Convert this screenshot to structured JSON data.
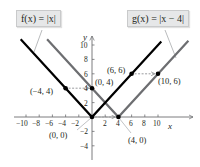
{
  "chart_data": {
    "type": "line",
    "title": "",
    "xlabel": "x",
    "ylabel": "y",
    "xlim": [
      -11,
      14.5
    ],
    "ylim": [
      -5,
      11
    ],
    "grid": false,
    "x_ticks": [
      -10,
      -8,
      -6,
      -4,
      -2,
      2,
      4,
      6,
      8,
      10
    ],
    "y_ticks": [
      -4,
      -2,
      2,
      4,
      6,
      8,
      10
    ],
    "x_tick_labels": [
      "−10",
      "−8",
      "−6",
      "−4",
      "−2",
      "2",
      "4",
      "6",
      "8",
      "10"
    ],
    "y_tick_labels": [
      "−4",
      "−2",
      "2",
      "4",
      "6",
      "8",
      "10"
    ],
    "series": [
      {
        "name": "f(x) = |x|",
        "color": "#000000",
        "x": [
          -10.8,
          0,
          10.5
        ],
        "y": [
          10.8,
          0,
          10.5
        ]
      },
      {
        "name": "g(x) = |x − 4|",
        "color": "#6d6e71",
        "x": [
          -6.8,
          4,
          14.6
        ],
        "y": [
          10.8,
          0,
          10.6
        ]
      }
    ],
    "points": [
      {
        "label": "(−4, 4)",
        "x": -4,
        "y": 4,
        "series": "f"
      },
      {
        "label": "(0, 4)",
        "x": 0,
        "y": 4,
        "series": "g"
      },
      {
        "label": "(6, 6)",
        "x": 6,
        "y": 6,
        "series": "f"
      },
      {
        "label": "(10, 6)",
        "x": 10,
        "y": 6,
        "series": "g"
      },
      {
        "label": "(0, 0)",
        "x": 0,
        "y": 0,
        "series": "f"
      },
      {
        "label": "(4, 0)",
        "x": 4,
        "y": 0,
        "series": "g"
      }
    ],
    "annotations": [
      {
        "type": "dashed-arrow",
        "from": [
          -4,
          4
        ],
        "to": [
          0,
          4
        ]
      },
      {
        "type": "dashed-arrow",
        "from": [
          6,
          6
        ],
        "to": [
          10,
          6
        ]
      },
      {
        "type": "dashed-arrow",
        "from": [
          0,
          0
        ],
        "to": [
          4,
          0
        ]
      }
    ],
    "legend": [
      {
        "label": "f(x) = |x|",
        "position": "top-left callout"
      },
      {
        "label": "g(x) = |x − 4|",
        "position": "top-right callout"
      }
    ]
  },
  "labels": {
    "f_box": "f(x) = |x|",
    "g_box": "g(x) = |x − 4|",
    "x_axis": "x",
    "y_axis": "y",
    "pt_m4_4": "(−4, 4)",
    "pt_0_4": "(0, 4)",
    "pt_6_6": "(6, 6)",
    "pt_10_6": "(10, 6)",
    "pt_0_0": "(0, 0)",
    "pt_4_0": "(4, 0)",
    "xt": {
      "m10": "−10",
      "m8": "−8",
      "m6": "−6",
      "m4": "−4",
      "m2": "−2",
      "p2": "2",
      "p4": "4",
      "p6": "6",
      "p8": "8",
      "p10": "10"
    },
    "yt": {
      "p10": "10",
      "p8": "8",
      "p6": "6",
      "p4": "4",
      "p2": "2",
      "m2": "−2",
      "m4": "−4"
    }
  },
  "colors": {
    "f_line": "#000000",
    "g_line": "#6d6e71",
    "axis": "#6d6e71",
    "callout_bg": "#e6e7e8",
    "leader": "#a7a9ac"
  }
}
